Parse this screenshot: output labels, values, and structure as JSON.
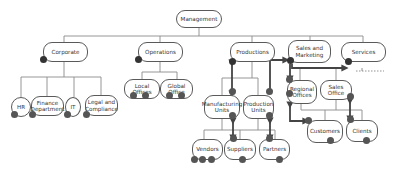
{
  "diagram": {
    "type": "organizational-chart",
    "root": {
      "id": "management",
      "label": "Management"
    },
    "nodes": [
      {
        "id": "management",
        "label": "Management",
        "x": 176,
        "y": 10,
        "w": 46,
        "h": 18
      },
      {
        "id": "corporate",
        "label": "Corporate",
        "x": 43,
        "y": 42,
        "w": 45,
        "h": 20
      },
      {
        "id": "operations",
        "label": "Operations",
        "x": 138,
        "y": 42,
        "w": 45,
        "h": 20
      },
      {
        "id": "productions",
        "label": "Productions",
        "x": 230,
        "y": 42,
        "w": 45,
        "h": 20
      },
      {
        "id": "sales_marketing",
        "label": "Sales and Marketing",
        "x": 288,
        "y": 40,
        "w": 43,
        "h": 23
      },
      {
        "id": "services",
        "label": "Services",
        "x": 341,
        "y": 42,
        "w": 45,
        "h": 20
      },
      {
        "id": "hr",
        "label": "HR",
        "x": 11,
        "y": 97,
        "w": 20,
        "h": 20
      },
      {
        "id": "finance",
        "label": "Finance Department",
        "x": 31,
        "y": 96,
        "w": 33,
        "h": 20
      },
      {
        "id": "it",
        "label": "IT",
        "x": 65,
        "y": 97,
        "w": 16,
        "h": 20
      },
      {
        "id": "legal",
        "label": "Legal and Compliance",
        "x": 85,
        "y": 95,
        "w": 33,
        "h": 21
      },
      {
        "id": "local_offices",
        "label": "Local Offices",
        "x": 124,
        "y": 79,
        "w": 36,
        "h": 20
      },
      {
        "id": "global_office",
        "label": "Global Office",
        "x": 160,
        "y": 79,
        "w": 33,
        "h": 20
      },
      {
        "id": "manufacturing_units",
        "label": "Manufacturing Units",
        "x": 204,
        "y": 95,
        "w": 36,
        "h": 24
      },
      {
        "id": "production_units",
        "label": "Production Units",
        "x": 243,
        "y": 95,
        "w": 31,
        "h": 24
      },
      {
        "id": "regional_offices",
        "label": "Regional Offices",
        "x": 287,
        "y": 80,
        "w": 30,
        "h": 24
      },
      {
        "id": "sales_office",
        "label": "Sales Office",
        "x": 320,
        "y": 80,
        "w": 32,
        "h": 20
      },
      {
        "id": "customers",
        "label": "Customers",
        "x": 307,
        "y": 120,
        "w": 36,
        "h": 23
      },
      {
        "id": "clients",
        "label": "Clients",
        "x": 346,
        "y": 120,
        "w": 32,
        "h": 22
      },
      {
        "id": "vendors",
        "label": "Vendors",
        "x": 192,
        "y": 139,
        "w": 31,
        "h": 21
      },
      {
        "id": "suppliers",
        "label": "Suppliers",
        "x": 224,
        "y": 139,
        "w": 32,
        "h": 21
      },
      {
        "id": "partners",
        "label": "Partners",
        "x": 259,
        "y": 139,
        "w": 31,
        "h": 21
      }
    ],
    "edges": [
      {
        "from": "management",
        "to": "corporate"
      },
      {
        "from": "management",
        "to": "operations"
      },
      {
        "from": "management",
        "to": "productions"
      },
      {
        "from": "management",
        "to": "sales_marketing"
      },
      {
        "from": "management",
        "to": "services"
      },
      {
        "from": "corporate",
        "to": "hr"
      },
      {
        "from": "corporate",
        "to": "finance"
      },
      {
        "from": "corporate",
        "to": "it"
      },
      {
        "from": "corporate",
        "to": "legal"
      },
      {
        "from": "operations",
        "to": "local_offices"
      },
      {
        "from": "operations",
        "to": "global_office"
      },
      {
        "from": "productions",
        "to": "manufacturing_units"
      },
      {
        "from": "productions",
        "to": "production_units"
      },
      {
        "from": "manufacturing_units",
        "to": "vendors"
      },
      {
        "from": "manufacturing_units",
        "to": "suppliers"
      },
      {
        "from": "production_units",
        "to": "suppliers"
      },
      {
        "from": "production_units",
        "to": "partners"
      },
      {
        "from": "sales_marketing",
        "to": "regional_offices"
      },
      {
        "from": "sales_marketing",
        "to": "sales_office"
      },
      {
        "from": "regional_offices",
        "to": "customers"
      },
      {
        "from": "regional_offices",
        "to": "clients"
      },
      {
        "from": "sales_office",
        "to": "customers"
      },
      {
        "from": "sales_office",
        "to": "clients"
      }
    ],
    "highlighted_flows": [
      {
        "from": "productions",
        "to": "manufacturing_units",
        "style": "thick-bidirectional"
      },
      {
        "from": "manufacturing_units",
        "to": "suppliers",
        "style": "thick-bidirectional"
      },
      {
        "from": "production_units",
        "to": "sales_marketing",
        "style": "thick-elbow-arrow"
      },
      {
        "from": "sales_marketing",
        "to": "services",
        "style": "thick-arrow"
      },
      {
        "from": "production_units",
        "to": "partners",
        "style": "thick-bidirectional"
      },
      {
        "from": "regional_offices",
        "to": "customers",
        "style": "thick-elbow-bidirectional"
      },
      {
        "from": "sales_office",
        "to": "clients",
        "style": "thick-bidirectional"
      },
      {
        "from": "services",
        "to": "unspecified",
        "style": "dashed"
      }
    ],
    "colors": {
      "node_border": "#5a5a5a",
      "node_fill": "#ffffff",
      "connector": "#7a7a7a",
      "highlight": "#444444",
      "port_dot": "#555555",
      "text": "#333333"
    }
  }
}
